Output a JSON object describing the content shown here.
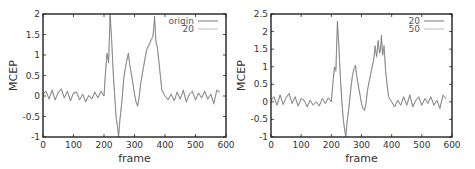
{
  "chart_data": [
    {
      "type": "line",
      "title": "",
      "xlabel": "frame",
      "ylabel": "MCEP",
      "xlim": [
        0,
        600
      ],
      "ylim": [
        -1,
        2
      ],
      "xticks": [
        0,
        100,
        200,
        300,
        400,
        500,
        600
      ],
      "yticks": [
        -1,
        -0.5,
        0,
        0.5,
        1,
        1.5,
        2
      ],
      "ytick_labels": [
        "-1",
        "-0.5",
        "0",
        "0.5",
        "1",
        "1.5",
        "2"
      ],
      "grid": false,
      "legend_position": "upper right",
      "x": [
        0,
        10,
        20,
        30,
        40,
        50,
        60,
        70,
        80,
        90,
        100,
        110,
        120,
        130,
        140,
        150,
        160,
        170,
        180,
        190,
        200,
        205,
        210,
        215,
        220,
        225,
        230,
        235,
        240,
        245,
        248,
        252,
        258,
        265,
        270,
        275,
        280,
        285,
        290,
        295,
        300,
        305,
        310,
        315,
        320,
        330,
        340,
        350,
        355,
        360,
        363,
        366,
        370,
        375,
        380,
        385,
        390,
        400,
        410,
        420,
        430,
        440,
        450,
        460,
        470,
        480,
        490,
        500,
        510,
        520,
        530,
        540,
        550,
        560,
        570,
        580
      ],
      "series": [
        {
          "name": "origin",
          "color": "#777777",
          "values": [
            0.05,
            0.12,
            -0.08,
            0.15,
            -0.1,
            0.1,
            0.18,
            -0.05,
            0.12,
            -0.12,
            0.08,
            0.1,
            -0.1,
            0.05,
            -0.15,
            0.02,
            -0.08,
            0.1,
            -0.05,
            0.12,
            0.0,
            0.6,
            1.05,
            0.8,
            2.0,
            1.4,
            0.6,
            0.0,
            -0.55,
            -0.8,
            -1.0,
            -0.6,
            -0.2,
            0.45,
            0.7,
            0.9,
            1.05,
            0.75,
            0.55,
            0.3,
            0.05,
            -0.15,
            -0.25,
            -0.05,
            0.3,
            0.75,
            1.15,
            1.3,
            1.4,
            1.45,
            1.65,
            1.95,
            1.35,
            1.2,
            0.85,
            0.5,
            0.15,
            0.0,
            -0.1,
            0.05,
            -0.12,
            0.1,
            -0.08,
            0.15,
            -0.15,
            0.05,
            0.12,
            -0.1,
            0.08,
            -0.05,
            0.12,
            -0.08,
            0.05,
            -0.2,
            0.15,
            0.1
          ]
        },
        {
          "name": "20",
          "color": "#bbbbbb",
          "values": [
            0.02,
            0.1,
            -0.05,
            0.12,
            -0.08,
            0.08,
            0.15,
            -0.03,
            0.1,
            -0.1,
            0.06,
            0.08,
            -0.08,
            0.03,
            -0.12,
            0.0,
            -0.06,
            0.08,
            -0.03,
            0.1,
            0.0,
            0.55,
            1.0,
            0.85,
            1.95,
            1.35,
            0.55,
            0.0,
            -0.5,
            -0.75,
            -0.95,
            -0.55,
            -0.15,
            0.4,
            0.65,
            0.85,
            1.0,
            0.7,
            0.5,
            0.28,
            0.03,
            -0.12,
            -0.22,
            -0.03,
            0.28,
            0.7,
            1.1,
            1.25,
            1.35,
            1.4,
            1.6,
            1.85,
            1.3,
            1.15,
            0.8,
            0.45,
            0.12,
            0.0,
            -0.08,
            0.03,
            -0.1,
            0.08,
            -0.06,
            0.12,
            -0.12,
            0.03,
            0.1,
            -0.08,
            0.06,
            -0.03,
            0.1,
            -0.06,
            0.03,
            -0.15,
            0.12,
            0.08
          ]
        }
      ]
    },
    {
      "type": "line",
      "title": "",
      "xlabel": "frame",
      "ylabel": "MCEP",
      "xlim": [
        0,
        600
      ],
      "ylim": [
        -1,
        2.5
      ],
      "xticks": [
        0,
        100,
        200,
        300,
        400,
        500,
        600
      ],
      "yticks": [
        -1,
        -0.5,
        0,
        0.5,
        1,
        1.5,
        2,
        2.5
      ],
      "ytick_labels": [
        "-1",
        "-0.5",
        "0",
        "0.5",
        "1",
        "1.5",
        "2",
        "2.5"
      ],
      "grid": false,
      "legend_position": "upper right",
      "x": [
        0,
        10,
        20,
        30,
        40,
        50,
        60,
        70,
        80,
        90,
        100,
        110,
        120,
        130,
        140,
        150,
        160,
        170,
        180,
        190,
        200,
        205,
        210,
        215,
        220,
        225,
        230,
        235,
        240,
        245,
        248,
        252,
        258,
        265,
        270,
        275,
        280,
        285,
        290,
        295,
        300,
        305,
        310,
        315,
        320,
        330,
        340,
        345,
        350,
        355,
        360,
        363,
        366,
        370,
        375,
        380,
        385,
        390,
        400,
        410,
        420,
        430,
        440,
        450,
        460,
        470,
        480,
        490,
        500,
        510,
        520,
        530,
        540,
        550,
        560,
        570,
        580
      ],
      "series": [
        {
          "name": "20",
          "color": "#777777",
          "values": [
            0.05,
            0.15,
            -0.1,
            0.2,
            -0.08,
            0.12,
            0.25,
            -0.05,
            0.15,
            -0.12,
            0.1,
            0.05,
            -0.15,
            0.05,
            -0.1,
            0.0,
            -0.12,
            0.1,
            -0.05,
            0.12,
            0.0,
            0.5,
            1.0,
            0.9,
            2.3,
            1.6,
            0.7,
            0.0,
            -0.55,
            -0.85,
            -1.0,
            -0.6,
            -0.2,
            0.4,
            0.75,
            0.95,
            1.05,
            0.7,
            0.45,
            0.2,
            -0.05,
            -0.2,
            -0.25,
            -0.05,
            0.35,
            0.8,
            1.2,
            1.6,
            1.3,
            1.75,
            1.4,
            1.5,
            1.9,
            1.35,
            1.6,
            0.9,
            0.5,
            0.15,
            0.0,
            -0.15,
            0.05,
            -0.1,
            0.15,
            -0.1,
            0.2,
            -0.15,
            0.05,
            0.15,
            -0.1,
            0.1,
            -0.05,
            0.15,
            -0.1,
            0.05,
            -0.2,
            0.2,
            0.1
          ]
        },
        {
          "name": "50",
          "color": "#bbbbbb",
          "values": [
            0.02,
            0.12,
            -0.08,
            0.18,
            -0.05,
            0.1,
            0.2,
            -0.03,
            0.12,
            -0.1,
            0.08,
            0.03,
            -0.12,
            0.03,
            -0.08,
            0.0,
            -0.1,
            0.08,
            -0.03,
            0.1,
            0.0,
            0.45,
            0.95,
            0.85,
            2.2,
            1.5,
            0.65,
            0.0,
            -0.5,
            -0.8,
            -0.95,
            -0.55,
            -0.15,
            0.35,
            0.7,
            0.9,
            1.0,
            0.65,
            0.4,
            0.18,
            -0.03,
            -0.18,
            -0.22,
            -0.03,
            0.3,
            0.75,
            1.15,
            1.5,
            1.25,
            1.65,
            1.35,
            1.45,
            1.8,
            1.3,
            1.5,
            0.85,
            0.45,
            0.12,
            0.0,
            -0.12,
            0.03,
            -0.08,
            0.12,
            -0.08,
            0.18,
            -0.12,
            0.03,
            0.12,
            -0.08,
            0.08,
            -0.03,
            0.12,
            -0.08,
            0.03,
            -0.15,
            0.15,
            0.08
          ]
        }
      ]
    }
  ],
  "plots": [
    {
      "legend": [
        "origin",
        "20"
      ],
      "xlabel": "frame",
      "ylabel": "MCEP"
    },
    {
      "legend": [
        "20",
        "50"
      ],
      "xlabel": "frame",
      "ylabel": "MCEP"
    }
  ]
}
